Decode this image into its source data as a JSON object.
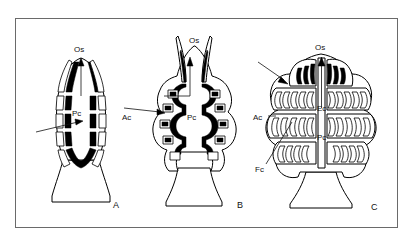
{
  "figure": {
    "background_color": "#ffffff",
    "frame_color": "#6a6a6a",
    "ink_color": "#000000",
    "panels": [
      {
        "id": "A",
        "letter": "A",
        "description": "Simple chamber with undivided principal cavity and segmented wall",
        "labels": [
          {
            "name": "os",
            "text": "Os",
            "x": 81,
            "y": 52
          },
          {
            "name": "pc",
            "text": "Pc",
            "x": 79,
            "y": 116
          }
        ]
      },
      {
        "id": "B",
        "letter": "B",
        "description": "Chamber with accessory cavities branching from the principal cavity",
        "labels": [
          {
            "name": "os",
            "text": "Os",
            "x": 196,
            "y": 43
          },
          {
            "name": "ac",
            "text": "Ac",
            "x": 129,
            "y": 116
          },
          {
            "name": "pc",
            "text": "Pc",
            "x": 194,
            "y": 120
          }
        ]
      },
      {
        "id": "C",
        "letter": "C",
        "description": "Chamber with densely folded exocyclic and fistulose cavities",
        "labels": [
          {
            "name": "os",
            "text": "Os",
            "x": 322,
            "y": 50
          },
          {
            "name": "ac",
            "text": "Ac",
            "x": 256,
            "y": 117
          },
          {
            "name": "ec",
            "text": "Ec",
            "x": 322,
            "y": 108
          },
          {
            "name": "pc",
            "text": "Pc",
            "x": 322,
            "y": 137
          },
          {
            "name": "fc",
            "text": "Fc",
            "x": 258,
            "y": 169
          }
        ]
      }
    ],
    "panel_letters": [
      {
        "name": "panel-letter-a",
        "text": "A",
        "x": 116,
        "y": 205
      },
      {
        "name": "panel-letter-b",
        "text": "B",
        "x": 240,
        "y": 205
      },
      {
        "name": "panel-letter-c",
        "text": "C",
        "x": 374,
        "y": 207
      }
    ],
    "legend_keys": [
      {
        "abbr": "Os",
        "meaning": "Ostium"
      },
      {
        "abbr": "Pc",
        "meaning": "Principal cavity"
      },
      {
        "abbr": "Ac",
        "meaning": "Accessory cavity"
      },
      {
        "abbr": "Ec",
        "meaning": "Exocyclic cavity"
      },
      {
        "abbr": "Fc",
        "meaning": "Fistulose cavity"
      }
    ]
  }
}
